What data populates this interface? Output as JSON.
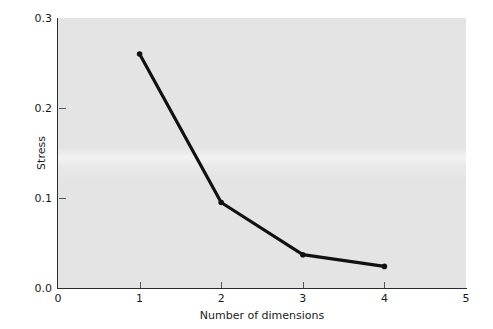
{
  "chart_data": {
    "type": "line",
    "title": "",
    "subtitle": "",
    "xlabel": "Number of dimensions",
    "ylabel": "Stress",
    "x": [
      1,
      2,
      3,
      4
    ],
    "values": [
      0.26,
      0.095,
      0.037,
      0.024
    ],
    "series": [
      {
        "name": "Stress",
        "x": [
          1,
          2,
          3,
          4
        ],
        "values": [
          0.26,
          0.095,
          0.037,
          0.024
        ]
      }
    ],
    "xlim": [
      0,
      5
    ],
    "ylim": [
      0.0,
      0.3
    ],
    "xticks": [
      0,
      1,
      2,
      3,
      4,
      5
    ],
    "xtick_labels": [
      "0",
      "1",
      "2",
      "3",
      "4",
      "5"
    ],
    "yticks": [
      0.0,
      0.1,
      0.2,
      0.3
    ],
    "ytick_labels": [
      "0.0",
      "0.1",
      "0.2",
      "0.3"
    ],
    "grid": false,
    "legend": null,
    "legend_position": "none",
    "annotations": [],
    "colors": {
      "line": "#111111",
      "marker": "#111111",
      "panel_background": "#e4e4e4",
      "figure_background": "#ffffff",
      "axis": "#2b2b2b",
      "text": "#1a1a1a"
    },
    "line_width_px": 3,
    "marker": "circle",
    "marker_size_px": 5
  }
}
